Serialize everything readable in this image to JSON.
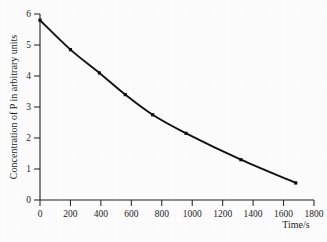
{
  "figure": {
    "background_color": "#fcfcfc",
    "curve_color": "#111111",
    "axis_color": "#1f1f1f",
    "marker_color": "#0d0d0d",
    "caption": ""
  },
  "chart_data": {
    "type": "line",
    "title": "",
    "subtitle": "",
    "xlabel": "Time/s",
    "ylabel": "Concentration of P in arbitrary units",
    "xlim": [
      0,
      1800
    ],
    "ylim": [
      0,
      6
    ],
    "xticks": [
      0,
      200,
      400,
      600,
      800,
      1000,
      1200,
      1400,
      1600,
      1800
    ],
    "xticklabels": [
      "0",
      "200",
      "400",
      "600",
      "800",
      "1000",
      "1200",
      "1400",
      "1600",
      "1800"
    ],
    "yticks": [
      0,
      1,
      2,
      3,
      4,
      5,
      6
    ],
    "yticklabels": [
      "0",
      "1",
      "2",
      "3",
      "4",
      "5",
      "6"
    ],
    "grid": false,
    "legend": null,
    "legend_position": "none",
    "markers": "square",
    "series": [
      {
        "name": "Concentration of P",
        "x": [
          0,
          200,
          390,
          560,
          740,
          960,
          1320,
          1680
        ],
        "y": [
          5.8,
          4.85,
          4.1,
          3.4,
          2.75,
          2.15,
          1.3,
          0.55
        ]
      }
    ],
    "annotations": []
  }
}
